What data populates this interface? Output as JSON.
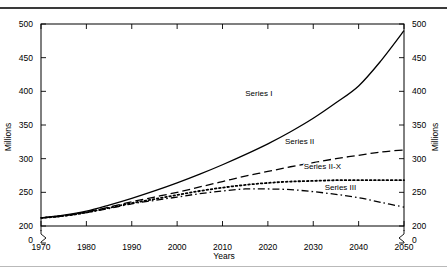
{
  "figure": {
    "background_color": "#ffffff",
    "line_color": "#000000",
    "top_rule": "horizontal-rule",
    "bottom_rule": "horizontal-rule"
  },
  "chart_data": {
    "type": "line",
    "title": "",
    "subtitle": "",
    "xlabel": "Years",
    "ylabel": "Millions",
    "ylabel_right": "Millions",
    "xlim": [
      1970,
      2050
    ],
    "ylim": [
      200,
      500
    ],
    "y_axis_break": true,
    "y_axis_break_note": "axis break drawn between 200 and 0 on both left and right axes",
    "grid": false,
    "legend_position": "inline-labels-on-curves",
    "xticks": [
      1970,
      1980,
      1990,
      2000,
      2010,
      2020,
      2030,
      2040,
      2050
    ],
    "xticklabels": [
      "1970",
      "1980",
      "1990",
      "2000",
      "2010",
      "2020",
      "2030",
      "2040",
      "2050"
    ],
    "yticks": [
      0,
      200,
      250,
      300,
      350,
      400,
      450,
      500
    ],
    "yticklabels": [
      "0",
      "200",
      "250",
      "300",
      "350",
      "400",
      "450",
      "500"
    ],
    "yticklabels_right": [
      "0",
      "200",
      "250",
      "300",
      "350",
      "400",
      "450",
      "500"
    ],
    "x": [
      1970,
      1975,
      1980,
      1985,
      1990,
      1995,
      2000,
      2005,
      2010,
      2015,
      2020,
      2025,
      2030,
      2035,
      2040,
      2045,
      2050
    ],
    "series": [
      {
        "name": "Series I",
        "linestyle": "solid",
        "label_x": 2018,
        "label_y": 393,
        "values": [
          212,
          216,
          222,
          231,
          241,
          252,
          264,
          277,
          291,
          306,
          322,
          340,
          360,
          383,
          408,
          446,
          490
        ]
      },
      {
        "name": "Series II",
        "linestyle": "dashed",
        "label_x": 2027,
        "label_y": 322,
        "values": [
          212,
          215,
          221,
          228,
          236,
          243,
          250,
          258,
          266,
          274,
          281,
          288,
          294,
          300,
          305,
          310,
          313
        ]
      },
      {
        "name": "Series II-X",
        "linestyle": "dotted",
        "label_x": 2032,
        "label_y": 285,
        "values": [
          212,
          215,
          220,
          227,
          234,
          240,
          246,
          252,
          257,
          261,
          264,
          266,
          267,
          268,
          268,
          268,
          268
        ]
      },
      {
        "name": "Series III",
        "linestyle": "dashdot",
        "label_x": 2036,
        "label_y": 254,
        "values": [
          212,
          215,
          220,
          226,
          233,
          238,
          243,
          248,
          252,
          255,
          255,
          254,
          251,
          247,
          242,
          235,
          228
        ]
      }
    ]
  }
}
